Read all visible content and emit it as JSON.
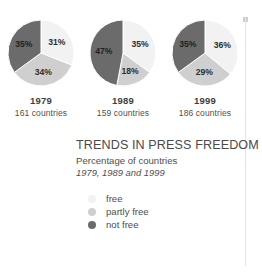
{
  "chart_data": {
    "type": "pie",
    "title": "TRENDS IN PRESS FREEDOM",
    "subtitle": "Percentage of countries",
    "subtitle2": "1979, 1989 and 1999",
    "categories": [
      "free",
      "partly free",
      "not free"
    ],
    "colors": {
      "free": "#f2f2f2",
      "partly_free": "#cfcfcf",
      "not_free": "#6b6b6b"
    },
    "unit": "%",
    "legend_position": "below-title",
    "charts": [
      {
        "year": "1979",
        "countries_label": "161 countries",
        "values": [
          31,
          34,
          35
        ],
        "labels": [
          "31%",
          "34%",
          "35%"
        ]
      },
      {
        "year": "1989",
        "countries_label": "159 countries",
        "values": [
          35,
          18,
          47
        ],
        "labels": [
          "35%",
          "18%",
          "47%"
        ]
      },
      {
        "year": "1999",
        "countries_label": "186 countries",
        "values": [
          36,
          29,
          35
        ],
        "labels": [
          "36%",
          "29%",
          "35%"
        ]
      }
    ]
  },
  "legend": {
    "items": [
      {
        "label": "free",
        "color": "#f2f2f2"
      },
      {
        "label": "partly free",
        "color": "#cfcfcf"
      },
      {
        "label": "not free",
        "color": "#6b6b6b"
      }
    ]
  }
}
